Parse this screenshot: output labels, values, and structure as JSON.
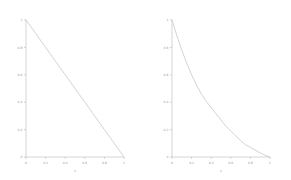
{
  "figure": {
    "background_color": "#ffffff",
    "line_color": "#c8c8c8",
    "axis_color": "#b9b9b9",
    "label_color": "#9a9a9a"
  },
  "chart_data": [
    {
      "type": "line",
      "title": "",
      "xlabel": "x",
      "ylabel": "",
      "xlim": [
        0,
        1
      ],
      "ylim": [
        0,
        1
      ],
      "grid": false,
      "legend": "none",
      "xticks": [
        "0",
        "0.2",
        "0.4",
        "0.6",
        "0.8",
        "1"
      ],
      "yticks": [
        "0",
        "0.2",
        "0.4",
        "0.6",
        "0.8",
        "1"
      ],
      "xtick_values": [
        0,
        0.2,
        0.4,
        0.6,
        0.8,
        1
      ],
      "ytick_values": [
        0,
        0.2,
        0.4,
        0.6,
        0.8,
        1
      ],
      "series": [
        {
          "name": "linear-decay",
          "x": [
            0,
            0.1,
            0.2,
            0.3,
            0.4,
            0.5,
            0.6,
            0.7,
            0.8,
            0.9,
            1
          ],
          "values": [
            1,
            0.9,
            0.8,
            0.7,
            0.6,
            0.5,
            0.4,
            0.3,
            0.2,
            0.1,
            0
          ]
        }
      ]
    },
    {
      "type": "line",
      "title": "",
      "xlabel": "x",
      "ylabel": "",
      "xlim": [
        0,
        1
      ],
      "ylim": [
        0,
        1
      ],
      "grid": false,
      "legend": "none",
      "xticks": [
        "0",
        "0.2",
        "0.4",
        "0.6",
        "0.8",
        "1"
      ],
      "yticks": [
        "0",
        "0.2",
        "0.4",
        "0.6",
        "0.8",
        "1"
      ],
      "xtick_values": [
        0,
        0.2,
        0.4,
        0.6,
        0.8,
        1
      ],
      "ytick_values": [
        0,
        0.2,
        0.4,
        0.6,
        0.8,
        1
      ],
      "series": [
        {
          "name": "convex-decay",
          "x": [
            0,
            0.05,
            0.1,
            0.15,
            0.2,
            0.25,
            0.3,
            0.35,
            0.4,
            0.45,
            0.5,
            0.55,
            0.6,
            0.65,
            0.7,
            0.75,
            0.8,
            0.85,
            0.9,
            0.95,
            1
          ],
          "values": [
            1,
            0.885,
            0.78,
            0.685,
            0.6,
            0.525,
            0.46,
            0.405,
            0.36,
            0.315,
            0.27,
            0.225,
            0.19,
            0.155,
            0.12,
            0.09,
            0.07,
            0.05,
            0.03,
            0.012,
            0
          ]
        }
      ]
    }
  ]
}
